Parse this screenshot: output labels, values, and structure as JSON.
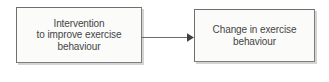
{
  "diagram": {
    "type": "flowchart",
    "orientation": "left-to-right",
    "background_color": "#ffffff",
    "node_fill_color": "#fbfbfa",
    "node_border_color": "#7e7e7e",
    "text_color": "#454545",
    "connector_color": "#6b6b6b",
    "nodes": [
      {
        "id": "intervention",
        "label": "Intervention\nto improve exercise\nbehaviour",
        "lines": [
          "Intervention",
          "to improve exercise",
          "behaviour"
        ]
      },
      {
        "id": "change",
        "label": "Change in exercise\nbehaviour",
        "lines": [
          "Change in exercise",
          "behaviour"
        ]
      }
    ],
    "connectors": [
      {
        "id": "intervention-to-change",
        "from": "intervention",
        "to": "change",
        "style": "solid-line-with-filled-arrowhead",
        "label": ""
      }
    ]
  }
}
